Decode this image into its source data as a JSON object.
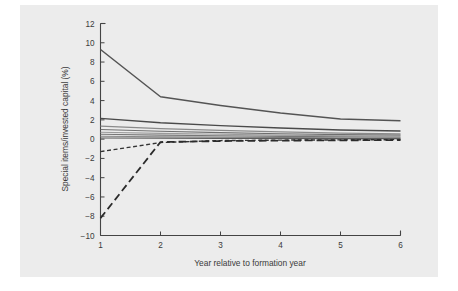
{
  "figure": {
    "background_color": "#ffffff",
    "panel_color": "#ececec",
    "axis_color": "#444444"
  },
  "chart_data": {
    "type": "line",
    "title": "",
    "xlabel": "Year relative to formation year",
    "ylabel": "Special items/invested capital (%)",
    "x": [
      1,
      2,
      3,
      4,
      5,
      6
    ],
    "xlim": [
      1,
      6
    ],
    "ylim": [
      -10,
      12
    ],
    "xticks": [
      1,
      2,
      3,
      4,
      5,
      6
    ],
    "xticklabels": [
      "1",
      "2",
      "3",
      "4",
      "5",
      "6"
    ],
    "yticks": [
      -10,
      -8,
      -6,
      -4,
      -2,
      0,
      2,
      4,
      6,
      8,
      10,
      12
    ],
    "yticklabels": [
      "-10",
      "-8",
      "-6",
      "-4",
      "-2",
      "0",
      "2",
      "4",
      "6",
      "8",
      "10",
      "12"
    ],
    "grid": false,
    "legend": "none",
    "series": [
      {
        "name": "series-1",
        "style": "solid",
        "color": "#545454",
        "width": 1.5,
        "values": [
          9.3,
          4.4,
          3.5,
          2.7,
          2.1,
          1.9
        ]
      },
      {
        "name": "series-2",
        "style": "solid",
        "color": "#4a4a4a",
        "width": 1.4,
        "values": [
          2.15,
          1.7,
          1.4,
          1.15,
          0.95,
          0.85
        ]
      },
      {
        "name": "series-3",
        "style": "solid",
        "color": "#8a8a8a",
        "width": 1.2,
        "values": [
          1.35,
          1.1,
          0.9,
          0.75,
          0.62,
          0.55
        ]
      },
      {
        "name": "series-4",
        "style": "solid",
        "color": "#6e6e6e",
        "width": 1.2,
        "values": [
          1.0,
          0.82,
          0.68,
          0.56,
          0.47,
          0.42
        ]
      },
      {
        "name": "series-5",
        "style": "solid",
        "color": "#9a9a9a",
        "width": 1.1,
        "values": [
          0.72,
          0.6,
          0.5,
          0.42,
          0.35,
          0.3
        ]
      },
      {
        "name": "series-6",
        "style": "solid",
        "color": "#777777",
        "width": 1.1,
        "values": [
          0.5,
          0.42,
          0.35,
          0.29,
          0.24,
          0.2
        ]
      },
      {
        "name": "series-7",
        "style": "solid",
        "color": "#888888",
        "width": 1.1,
        "values": [
          0.3,
          0.25,
          0.21,
          0.17,
          0.14,
          0.12
        ]
      },
      {
        "name": "series-8",
        "style": "solid",
        "color": "#5c5c5c",
        "width": 1.2,
        "values": [
          0.12,
          0.1,
          0.08,
          0.07,
          0.06,
          0.05
        ]
      },
      {
        "name": "series-9-dashed-short",
        "style": "dashed-short",
        "color": "#333333",
        "width": 1.4,
        "values": [
          -1.3,
          -0.35,
          -0.15,
          -0.1,
          -0.08,
          -0.05
        ]
      },
      {
        "name": "series-10-dashed-long",
        "style": "dashed-long",
        "color": "#2b2b2b",
        "width": 1.8,
        "values": [
          -8.2,
          -0.3,
          -0.2,
          -0.15,
          -0.12,
          -0.1
        ]
      }
    ]
  }
}
